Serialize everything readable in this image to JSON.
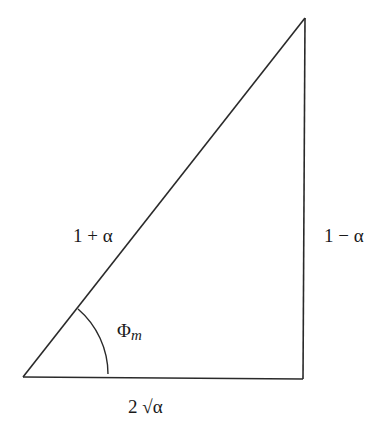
{
  "diagram": {
    "type": "right-triangle",
    "line_color": "#2a2a2a",
    "vertices": {
      "bottom_left": [
        23,
        377
      ],
      "top_right": [
        305,
        18
      ],
      "bottom_right": [
        303,
        379
      ]
    },
    "labels": {
      "hypotenuse": "1 + α",
      "vertical_leg": "1 − α",
      "horizontal_leg": "2 √α",
      "angle_symbol": "Φ",
      "angle_subscript": "m"
    },
    "angle_arc": {
      "vertex": "bottom_left",
      "label": "Φm"
    }
  }
}
